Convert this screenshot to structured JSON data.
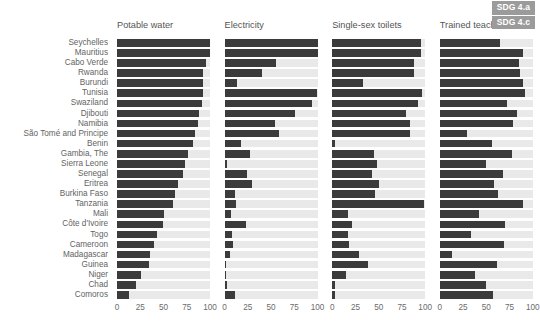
{
  "badge": {
    "lines": [
      "SDG 4.a",
      "SDG 4.c"
    ],
    "background": "#9b9b9b",
    "color": "#ffffff"
  },
  "colors": {
    "bar_fill": "#3b3b3b",
    "bar_track": "#e9e9e9",
    "text": "#636363",
    "background": "#ffffff"
  },
  "chart_data": {
    "type": "bar",
    "title": "",
    "subtitle": "",
    "orientation": "horizontal",
    "xlabel": "",
    "ylabel": "",
    "xlim": [
      0,
      100
    ],
    "xticks": [
      0,
      25,
      50,
      75,
      100
    ],
    "xtick_labels": [
      "0",
      "25",
      "50",
      "75",
      "100"
    ],
    "grid": false,
    "legend": [
      "SDG 4.a",
      "SDG 4.c"
    ],
    "legend_position": "top-right",
    "categories": [
      "Seychelles",
      "Mauritius",
      "Cabo Verde",
      "Rwanda",
      "Burundi",
      "Tunisia",
      "Swaziland",
      "Djibouti",
      "Namibia",
      "São Tomé and Principe",
      "Benin",
      "Gambia, The",
      "Sierra Leone",
      "Senegal",
      "Eritrea",
      "Burkina Faso",
      "Tanzania",
      "Mali",
      "Côte d'Ivoire",
      "Togo",
      "Cameroon",
      "Madagascar",
      "Guinea",
      "Niger",
      "Chad",
      "Comoros"
    ],
    "panels": [
      {
        "name": "potable-water",
        "title": "Potable water",
        "values": [
          100,
          100,
          96,
          93,
          93,
          92,
          91,
          88,
          87,
          84,
          82,
          76,
          73,
          71,
          66,
          62,
          60,
          51,
          49,
          43,
          40,
          36,
          34,
          26,
          20,
          13
        ]
      },
      {
        "name": "electricity",
        "title": "Electricity",
        "values": [
          100,
          100,
          55,
          40,
          13,
          99,
          94,
          76,
          54,
          58,
          18,
          27,
          3,
          24,
          30,
          11,
          12,
          7,
          23,
          8,
          9,
          6,
          2,
          2,
          3,
          11
        ]
      },
      {
        "name": "single-sex-toilets",
        "title": "Single-sex toilets",
        "values": [
          96,
          95,
          88,
          88,
          33,
          97,
          92,
          79,
          84,
          84,
          3,
          45,
          48,
          43,
          50,
          46,
          99,
          17,
          21,
          17,
          18,
          29,
          38,
          15,
          3,
          3
        ]
      },
      {
        "name": "trained-teachers",
        "title": "Trained teachers",
        "values": [
          65,
          89,
          85,
          86,
          90,
          92,
          72,
          83,
          79,
          29,
          56,
          78,
          50,
          68,
          58,
          63,
          90,
          42,
          70,
          34,
          69,
          13,
          62,
          38,
          50,
          57
        ]
      }
    ]
  }
}
